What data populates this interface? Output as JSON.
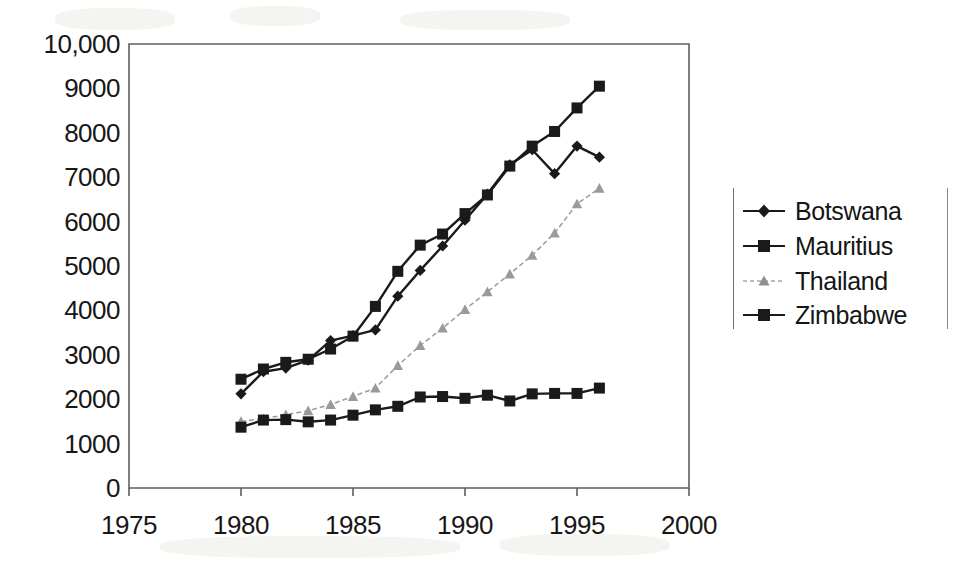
{
  "chart_data": {
    "type": "line",
    "title": "",
    "subtitle": "",
    "xlabel": "",
    "ylabel": "",
    "xlim": [
      1975,
      2000
    ],
    "ylim": [
      0,
      10000
    ],
    "grid": false,
    "legend_position": "right",
    "x_tick_labels": [
      "1975",
      "1980",
      "1985",
      "1990",
      "1995",
      "2000"
    ],
    "x_ticks": [
      1975,
      1980,
      1985,
      1990,
      1995,
      2000
    ],
    "y_tick_labels": [
      "10,000",
      "9000",
      "8000",
      "7000",
      "6000",
      "5000",
      "4000",
      "3000",
      "2000",
      "1000",
      "0"
    ],
    "y_ticks": [
      10000,
      9000,
      8000,
      7000,
      6000,
      5000,
      4000,
      3000,
      2000,
      1000,
      0
    ],
    "x": [
      1980,
      1981,
      1982,
      1983,
      1984,
      1985,
      1986,
      1987,
      1988,
      1989,
      1990,
      1991,
      1992,
      1993,
      1994,
      1995,
      1996
    ],
    "series": [
      {
        "name": "Botswana",
        "marker": "diamond",
        "color": "#1a1a1a",
        "values": [
          2120,
          2620,
          2700,
          2880,
          3320,
          3430,
          3560,
          4320,
          4900,
          5450,
          6030,
          6620,
          7280,
          7620,
          7080,
          7700,
          7450
        ]
      },
      {
        "name": "Mauritius",
        "marker": "square",
        "color": "#1a1a1a",
        "values": [
          2450,
          2680,
          2830,
          2900,
          3130,
          3420,
          4090,
          4880,
          5470,
          5720,
          6180,
          6600,
          7250,
          7700,
          8030,
          8560,
          9050
        ]
      },
      {
        "name": "Thailand",
        "marker": "triangle",
        "color": "#9a9a9a",
        "values": [
          1500,
          1560,
          1650,
          1740,
          1880,
          2060,
          2250,
          2760,
          3210,
          3600,
          4020,
          4420,
          4820,
          5240,
          5740,
          6400,
          6750
        ]
      },
      {
        "name": "Zimbabwe",
        "marker": "square",
        "color": "#1a1a1a",
        "values": [
          1370,
          1530,
          1540,
          1490,
          1530,
          1640,
          1760,
          1840,
          2050,
          2060,
          2020,
          2090,
          1960,
          2120,
          2130,
          2130,
          2250
        ]
      }
    ]
  },
  "axes": {
    "plot_left_px": 129,
    "plot_right_px": 689,
    "plot_top_px": 44,
    "plot_bottom_px": 488
  },
  "legend": {
    "items": [
      {
        "label": "Botswana",
        "marker": "diamond",
        "color": "#1a1a1a"
      },
      {
        "label": "Mauritius",
        "marker": "square",
        "color": "#1a1a1a"
      },
      {
        "label": "Thailand",
        "marker": "triangle",
        "color": "#9a9a9a"
      },
      {
        "label": "Zimbabwe",
        "marker": "square",
        "color": "#1a1a1a"
      }
    ]
  }
}
